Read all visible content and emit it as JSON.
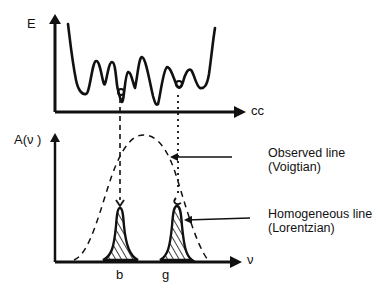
{
  "top_panel": {
    "y_axis_label": "E",
    "x_axis_label": "cc",
    "curve": "rugged energy landscape with multiple minima",
    "marked_minima": [
      "b",
      "g"
    ]
  },
  "bottom_panel": {
    "y_axis_label": "A(ν )",
    "x_axis_label": "ν",
    "tick_labels": [
      "b",
      "g"
    ],
    "envelope_curve": "dashed broad Gaussian-like band",
    "peaks": "hatched narrow peaks at b and g"
  },
  "annotations": [
    {
      "line1": "Observed line",
      "line2": "(Voigtian)"
    },
    {
      "line1": "Homogeneous line",
      "line2": "(Lorentzian)"
    }
  ],
  "colors": {
    "ink": "#111111",
    "background": "#ffffff"
  }
}
